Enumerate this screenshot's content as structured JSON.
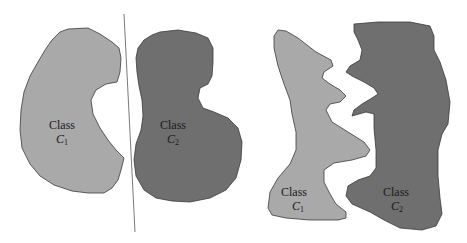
{
  "figure": {
    "panels": [
      {
        "id": "linearly-separable",
        "classes": [
          {
            "name": "Class",
            "symbol": "C",
            "subscript": "1",
            "fill": "#a9a9a9"
          },
          {
            "name": "Class",
            "symbol": "C",
            "subscript": "2",
            "fill": "#6f6f6f"
          }
        ],
        "has_separator_line": true
      },
      {
        "id": "nonlinearly-separable",
        "classes": [
          {
            "name": "Class",
            "symbol": "C",
            "subscript": "1",
            "fill": "#a9a9a9"
          },
          {
            "name": "Class",
            "symbol": "C",
            "subscript": "2",
            "fill": "#6f6f6f"
          }
        ],
        "has_separator_line": false
      }
    ],
    "colors": {
      "class1_fill": "#a9a9a9",
      "class2_fill": "#6f6f6f",
      "outline": "#3a3a3a",
      "separator": "#7a7a7a",
      "background": "#ffffff"
    }
  }
}
